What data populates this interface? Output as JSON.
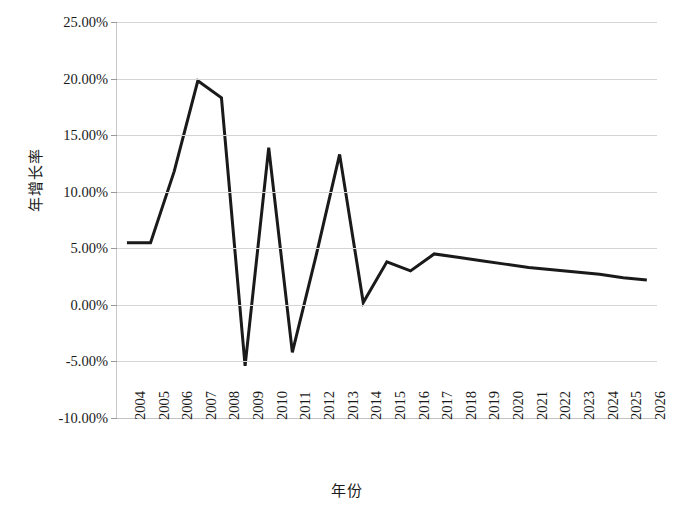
{
  "chart_data": {
    "type": "line",
    "title": "",
    "xlabel": "年份",
    "ylabel": "年增长率",
    "categories": [
      "2004",
      "2005",
      "2006",
      "2007",
      "2008",
      "2009",
      "2010",
      "2011",
      "2012",
      "2013",
      "2014",
      "2015",
      "2016",
      "2017",
      "2018",
      "2019",
      "2020",
      "2021",
      "2022",
      "2023",
      "2024",
      "2025",
      "2026"
    ],
    "values": [
      5.5,
      5.5,
      11.8,
      19.8,
      18.3,
      -5.4,
      13.9,
      -4.2,
      4.3,
      13.3,
      0.2,
      3.8,
      3.0,
      4.5,
      4.2,
      3.9,
      3.6,
      3.3,
      3.1,
      2.9,
      2.7,
      2.4,
      2.2
    ],
    "series": [
      {
        "name": "年增长率",
        "color": "#1a1a1a",
        "values": [
          5.5,
          5.5,
          11.8,
          19.8,
          18.3,
          -5.4,
          13.9,
          -4.2,
          4.3,
          13.3,
          0.2,
          3.8,
          3.0,
          4.5,
          4.2,
          3.9,
          3.6,
          3.3,
          3.1,
          2.9,
          2.7,
          2.4,
          2.2
        ]
      }
    ],
    "ylim": [
      -10,
      25
    ],
    "ytick_values": [
      25,
      20,
      15,
      10,
      5,
      0,
      -5,
      -10
    ],
    "ytick_labels": [
      "25.00%",
      "20.00%",
      "15.00%",
      "10.00%",
      "5.00%",
      "0.00%",
      "-5.00%",
      "-10.00%"
    ],
    "grid": true,
    "legend": false,
    "legend_position": "none",
    "line_color": "#1a1a1a",
    "line_width": 3,
    "grid_color": "#d4d4d4",
    "background_color": "#ffffff"
  }
}
